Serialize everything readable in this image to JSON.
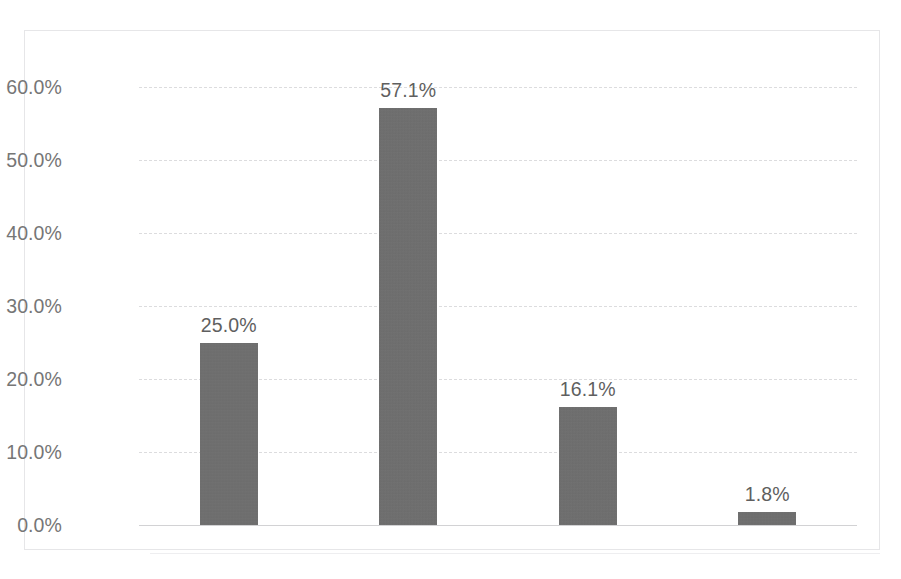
{
  "chart_data": {
    "type": "bar",
    "title": "",
    "subtitle": "",
    "xlabel": "",
    "ylabel": "",
    "categories": [
      "Strongly Agree",
      "Agree",
      "Neutral",
      "Disagree"
    ],
    "values": [
      25.0,
      57.1,
      16.1,
      1.8
    ],
    "data_labels": [
      "25.0%",
      "57.1%",
      "16.1%",
      "1.8%"
    ],
    "ylim": [
      0,
      60
    ],
    "ytick_values": [
      0,
      10,
      20,
      30,
      40,
      50,
      60
    ],
    "ytick_labels": [
      "0.0%",
      "10.0%",
      "20.0%",
      "30.0%",
      "40.0%",
      "50.0%",
      "60.0%"
    ],
    "grid": "horizontal-dashed",
    "legend": "none",
    "legend_entries": [],
    "series": [
      {
        "name": "Response share",
        "values": [
          25.0,
          57.1,
          16.1,
          1.8
        ]
      }
    ],
    "bar_color": "#6e6e6e",
    "gridline_color": "#dcdcde",
    "axis_text_color": "#767676",
    "data_label_color": "#5f5f5f",
    "plot_background": "#ffffff",
    "border_color": "#e6e6e8"
  },
  "axis": {
    "y_ticks": [
      {
        "label": "60.0%",
        "value": 60
      },
      {
        "label": "50.0%",
        "value": 50
      },
      {
        "label": "40.0%",
        "value": 40
      },
      {
        "label": "30.0%",
        "value": 30
      },
      {
        "label": "20.0%",
        "value": 20
      },
      {
        "label": "10.0%",
        "value": 10
      },
      {
        "label": "0.0%",
        "value": 0
      }
    ],
    "x_ticks": [
      {
        "label": "Strongly Agree"
      },
      {
        "label": "Agree"
      },
      {
        "label": "Neutral"
      },
      {
        "label": "Disagree"
      }
    ]
  },
  "bars": [
    {
      "category": "Strongly Agree",
      "label": "25.0%",
      "value": 25.0
    },
    {
      "category": "Agree",
      "label": "57.1%",
      "value": 57.1
    },
    {
      "category": "Neutral",
      "label": "16.1%",
      "value": 16.1
    },
    {
      "category": "Disagree",
      "label": "1.8%",
      "value": 1.8
    }
  ]
}
